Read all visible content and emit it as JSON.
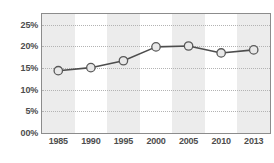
{
  "chart_data": {
    "type": "line",
    "title": "",
    "xlabel": "",
    "ylabel": "",
    "categories": [
      "1985",
      "1990",
      "1995",
      "2000",
      "2005",
      "2010",
      "2013"
    ],
    "values": [
      14.4,
      15.1,
      16.7,
      19.9,
      20.1,
      18.5,
      19.2
    ],
    "series": [
      {
        "name": "",
        "values": [
          14.4,
          15.1,
          16.7,
          19.9,
          20.1,
          18.5,
          19.2
        ]
      }
    ],
    "ylim": [
      0,
      27.5
    ],
    "yticks": [
      0,
      5,
      10,
      15,
      20,
      25
    ],
    "ytick_labels": [
      "00%",
      "5%",
      "10%",
      "15%",
      "20%",
      "25%"
    ],
    "xtick_labels": [
      "1985",
      "1990",
      "1995",
      "2000",
      "2005",
      "2010",
      "2013"
    ],
    "grid": "horizontal-dotted",
    "legend": "none",
    "banding": "alternating-vertical",
    "colors": {
      "line": "#4d4d4d",
      "marker_fill": "#e8e8e8",
      "marker_edge": "#595959",
      "band": "#ececec",
      "gridline": "#b3b3b3",
      "border": "#8c8c8c",
      "text": "#4d4d4d",
      "background": "#ffffff"
    }
  },
  "axes": {
    "y_ticks": [
      {
        "label": "25%",
        "value": 25
      },
      {
        "label": "20%",
        "value": 20
      },
      {
        "label": "15%",
        "value": 15
      },
      {
        "label": "10%",
        "value": 10
      },
      {
        "label": "5%",
        "value": 5
      },
      {
        "label": "00%",
        "value": 0
      }
    ],
    "x_ticks": [
      {
        "label": "1985",
        "value": 14.4
      },
      {
        "label": "1990",
        "value": 15.1
      },
      {
        "label": "1995",
        "value": 16.7
      },
      {
        "label": "2000",
        "value": 19.9
      },
      {
        "label": "2005",
        "value": 20.1
      },
      {
        "label": "2010",
        "value": 18.5
      },
      {
        "label": "2013",
        "value": 19.2
      }
    ]
  }
}
